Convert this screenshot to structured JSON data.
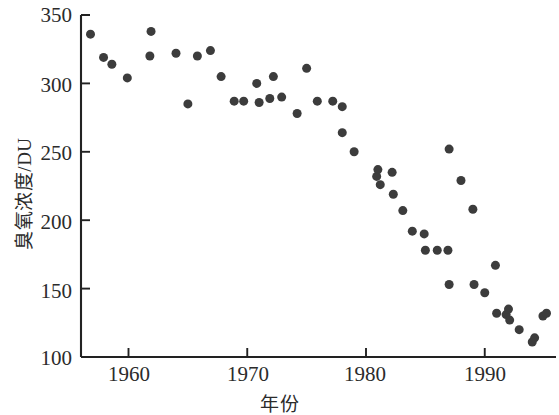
{
  "chart_data": {
    "type": "scatter",
    "title": "",
    "xlabel": "年份",
    "ylabel": "臭氧浓度/DU",
    "xlim": [
      1956,
      1996
    ],
    "ylim": [
      100,
      350
    ],
    "xticks": [
      1960,
      1970,
      1980,
      1990
    ],
    "xtick_labels": [
      "1960",
      "1970",
      "1980",
      "1990"
    ],
    "yticks": [
      100,
      150,
      200,
      250,
      300,
      350
    ],
    "ytick_labels": [
      "100",
      "150",
      "200",
      "250",
      "300",
      "350"
    ],
    "grid": false,
    "legend": null,
    "marker": {
      "shape": "circle",
      "color": "#3c3c3c",
      "size": 9
    },
    "series": [
      {
        "name": "臭氧浓度",
        "points": [
          [
            1956.8,
            336
          ],
          [
            1957.9,
            319
          ],
          [
            1958.6,
            314
          ],
          [
            1959.9,
            304
          ],
          [
            1961.8,
            320
          ],
          [
            1961.9,
            338
          ],
          [
            1964.0,
            322
          ],
          [
            1965.0,
            285
          ],
          [
            1965.8,
            320
          ],
          [
            1966.9,
            324
          ],
          [
            1967.8,
            305
          ],
          [
            1968.9,
            287
          ],
          [
            1969.7,
            287
          ],
          [
            1970.8,
            300
          ],
          [
            1971.0,
            286
          ],
          [
            1971.9,
            289
          ],
          [
            1972.2,
            305
          ],
          [
            1972.9,
            290
          ],
          [
            1974.2,
            278
          ],
          [
            1975.0,
            311
          ],
          [
            1975.9,
            287
          ],
          [
            1977.2,
            287
          ],
          [
            1978.0,
            283
          ],
          [
            1978.0,
            264
          ],
          [
            1979.0,
            250
          ],
          [
            1980.9,
            232
          ],
          [
            1981.0,
            237
          ],
          [
            1981.2,
            226
          ],
          [
            1982.2,
            235
          ],
          [
            1982.3,
            219
          ],
          [
            1983.1,
            207
          ],
          [
            1983.9,
            192
          ],
          [
            1984.9,
            190
          ],
          [
            1985.0,
            178
          ],
          [
            1986.0,
            178
          ],
          [
            1986.9,
            178
          ],
          [
            1987.0,
            153
          ],
          [
            1987.0,
            252
          ],
          [
            1988.0,
            229
          ],
          [
            1989.0,
            208
          ],
          [
            1989.1,
            153
          ],
          [
            1990.0,
            147
          ],
          [
            1990.9,
            167
          ],
          [
            1991.0,
            132
          ],
          [
            1991.8,
            131
          ],
          [
            1992.0,
            135
          ],
          [
            1992.1,
            127
          ],
          [
            1992.9,
            120
          ],
          [
            1994.0,
            111
          ],
          [
            1994.2,
            114
          ],
          [
            1994.9,
            130
          ],
          [
            1995.2,
            132
          ]
        ]
      }
    ]
  },
  "plot": {
    "axis_color": "#222222",
    "marker_color": "#3c3c3c",
    "background": "#ffffff"
  }
}
